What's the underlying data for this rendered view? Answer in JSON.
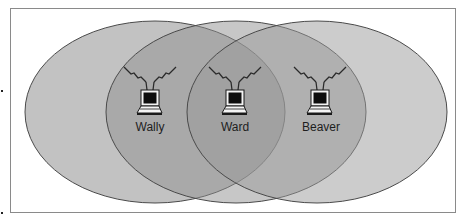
{
  "diagram": {
    "type": "overlapping-coverage-areas",
    "fill_color": "#8c8c8c",
    "stroke_color": "#555555",
    "nodes": [
      {
        "id": "wally",
        "label": "Wally",
        "cx": 155,
        "cy": 112
      },
      {
        "id": "ward",
        "label": "Ward",
        "cx": 236,
        "cy": 112
      },
      {
        "id": "beaver",
        "label": "Beaver",
        "cx": 318,
        "cy": 112
      }
    ]
  }
}
